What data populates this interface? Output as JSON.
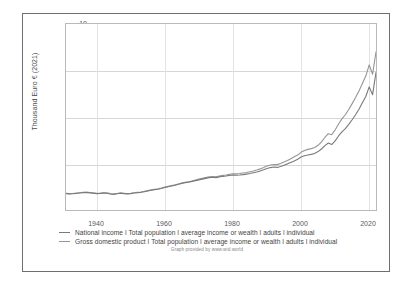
{
  "chart_data": {
    "type": "line",
    "title": "",
    "xlabel": "",
    "ylabel": "Thousand Euro € (2021)",
    "xlim": [
      1931,
      2022
    ],
    "ylim": [
      0,
      10
    ],
    "grid": true,
    "legend_position": "bottom",
    "xticks": [
      "1940",
      "1960",
      "1980",
      "2000",
      "2020"
    ],
    "xtick_values": [
      1940,
      1960,
      1980,
      2000,
      2020
    ],
    "yticks": [
      "2.5",
      "5",
      "7.5",
      "10"
    ],
    "ytick_values": [
      2.5,
      5,
      7.5,
      10
    ],
    "x": [
      1931,
      1932,
      1933,
      1934,
      1935,
      1936,
      1937,
      1938,
      1939,
      1940,
      1941,
      1942,
      1943,
      1944,
      1945,
      1946,
      1947,
      1948,
      1949,
      1950,
      1951,
      1952,
      1953,
      1954,
      1955,
      1956,
      1957,
      1958,
      1959,
      1960,
      1961,
      1962,
      1963,
      1964,
      1965,
      1966,
      1967,
      1968,
      1969,
      1970,
      1971,
      1972,
      1973,
      1974,
      1975,
      1976,
      1977,
      1978,
      1979,
      1980,
      1981,
      1982,
      1983,
      1984,
      1985,
      1986,
      1987,
      1988,
      1989,
      1990,
      1991,
      1992,
      1993,
      1994,
      1995,
      1996,
      1997,
      1998,
      1999,
      2000,
      2001,
      2002,
      2003,
      2004,
      2005,
      2006,
      2007,
      2008,
      2009,
      2010,
      2011,
      2012,
      2013,
      2014,
      2015,
      2016,
      2017,
      2018,
      2019,
      2020,
      2021,
      2022
    ],
    "series": [
      {
        "name": "Gross domestic product ǀ Total population ǀ average income or wealth ǀ adults ǀ individual",
        "color": "#96969a",
        "values": [
          0.9,
          0.88,
          0.89,
          0.91,
          0.93,
          0.95,
          0.96,
          0.94,
          0.92,
          0.9,
          0.91,
          0.93,
          0.92,
          0.88,
          0.86,
          0.89,
          0.92,
          0.9,
          0.88,
          0.9,
          0.93,
          0.95,
          0.97,
          1.0,
          1.04,
          1.08,
          1.11,
          1.14,
          1.18,
          1.23,
          1.27,
          1.31,
          1.35,
          1.4,
          1.45,
          1.49,
          1.52,
          1.56,
          1.61,
          1.66,
          1.7,
          1.74,
          1.78,
          1.8,
          1.78,
          1.83,
          1.86,
          1.88,
          1.92,
          1.95,
          1.94,
          1.96,
          1.99,
          2.02,
          2.06,
          2.1,
          2.15,
          2.21,
          2.28,
          2.36,
          2.42,
          2.45,
          2.44,
          2.5,
          2.58,
          2.66,
          2.76,
          2.86,
          2.96,
          3.1,
          3.2,
          3.26,
          3.3,
          3.36,
          3.48,
          3.66,
          3.9,
          4.1,
          4.05,
          4.3,
          4.62,
          4.9,
          5.12,
          5.4,
          5.72,
          6.05,
          6.4,
          6.8,
          7.2,
          7.8,
          7.3,
          8.5
        ]
      },
      {
        "name": "National income ǀ Total population ǀ average income or wealth ǀ adults ǀ individual",
        "color": "#7a7a7c",
        "values": [
          0.88,
          0.86,
          0.87,
          0.89,
          0.91,
          0.93,
          0.94,
          0.92,
          0.9,
          0.88,
          0.89,
          0.91,
          0.9,
          0.86,
          0.84,
          0.87,
          0.9,
          0.88,
          0.86,
          0.88,
          0.91,
          0.93,
          0.95,
          0.98,
          1.02,
          1.06,
          1.09,
          1.12,
          1.16,
          1.21,
          1.25,
          1.29,
          1.33,
          1.38,
          1.43,
          1.47,
          1.5,
          1.54,
          1.58,
          1.62,
          1.66,
          1.7,
          1.74,
          1.76,
          1.74,
          1.78,
          1.81,
          1.83,
          1.86,
          1.88,
          1.87,
          1.88,
          1.9,
          1.93,
          1.96,
          2.0,
          2.04,
          2.1,
          2.16,
          2.23,
          2.28,
          2.31,
          2.29,
          2.34,
          2.41,
          2.48,
          2.56,
          2.64,
          2.73,
          2.85,
          2.92,
          2.96,
          2.99,
          3.04,
          3.14,
          3.28,
          3.46,
          3.6,
          3.52,
          3.72,
          3.98,
          4.2,
          4.38,
          4.6,
          4.85,
          5.12,
          5.42,
          5.76,
          6.1,
          6.62,
          6.2,
          7.4
        ]
      }
    ]
  },
  "legend": {
    "entries": [
      {
        "label": "National income ǀ Total population ǀ average income or wealth ǀ adults ǀ individual"
      },
      {
        "label": "Gross domestic product ǀ Total population ǀ average income or wealth ǀ adults ǀ individual"
      }
    ]
  },
  "credit": "Graph provided by www.wid.world"
}
